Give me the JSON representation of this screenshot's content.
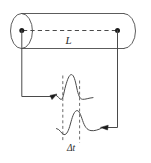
{
  "figure": {
    "type": "schematic-diagram",
    "background_color": "#ffffff",
    "stroke_color": "#4a4a4a",
    "text_color": "#2b2b2b",
    "labels": {
      "length_label": "L",
      "time_interval_label": "Δt"
    },
    "elements": [
      {
        "name": "cylinder-body",
        "description": "Horizontal cylinder (rod) drawn with a left end ellipse and a rounded right cap"
      },
      {
        "name": "length-dashed-line",
        "description": "Horizontal dashed line spanning the rod between the two marker dots, labelled L"
      },
      {
        "name": "left-end-dot",
        "description": "Filled dot at the centre of the left end face of the rod"
      },
      {
        "name": "right-end-dot",
        "description": "Filled dot at the centre of the right end face of the rod"
      },
      {
        "name": "left-signal-path",
        "description": "Lead line from the left end dot going down then right, terminating in an arrowhead pointing at the first pulse"
      },
      {
        "name": "right-signal-path",
        "description": "Lead line from the right end dot going down then left, terminating in an arrowhead pointing at the second pulse"
      },
      {
        "name": "first-pulse-trace",
        "description": "Upper oscilloscope trace showing the first received pulse"
      },
      {
        "name": "second-pulse-trace",
        "description": "Lower oscilloscope trace showing the second received pulse, delayed in time"
      },
      {
        "name": "time-marker-left",
        "description": "Vertical dashed cursor marking the arrival of the first pulse"
      },
      {
        "name": "time-marker-right",
        "description": "Vertical dashed cursor marking the arrival of the second pulse"
      }
    ]
  }
}
